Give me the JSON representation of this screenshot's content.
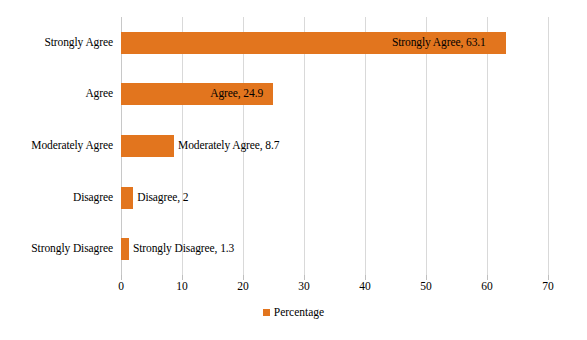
{
  "chart_data": {
    "type": "bar",
    "orientation": "horizontal",
    "title": "",
    "xlabel": "",
    "ylabel": "",
    "categories": [
      "Strongly Agree",
      "Agree",
      "Moderately Agree",
      "Disagree",
      "Strongly Disagree"
    ],
    "values": [
      63.1,
      24.9,
      8.7,
      2,
      1.3
    ],
    "point_labels": [
      "Strongly Agree, 63.1",
      "Agree, 24.9",
      "Moderately Agree, 8.7",
      "Disagree, 2",
      "Strongly Disagree, 1.3"
    ],
    "xlim": [
      0,
      70
    ],
    "xticks": [
      0,
      10,
      20,
      30,
      40,
      50,
      60,
      70
    ],
    "xtick_labels": [
      "0",
      "10",
      "20",
      "30",
      "40",
      "50",
      "60",
      "70"
    ],
    "grid": "vertical",
    "legend": {
      "position": "bottom-center",
      "entries": [
        {
          "name": "Percentage",
          "color": "#E2751E"
        }
      ]
    },
    "series": [
      {
        "name": "Percentage",
        "color": "#E2751E",
        "values": [
          63.1,
          24.9,
          8.7,
          2,
          1.3
        ]
      }
    ]
  },
  "colors": {
    "bar": "#E2751E",
    "gridline": "#d9d9d9",
    "background": "#ffffff",
    "text": "#000000"
  }
}
